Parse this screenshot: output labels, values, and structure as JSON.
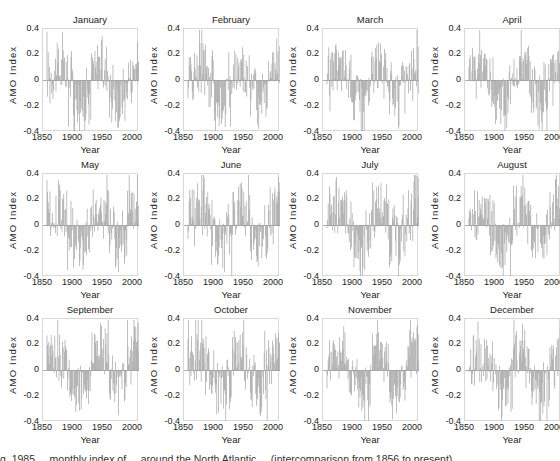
{
  "chart_data": {
    "type": "bar",
    "layout": "4x3 small multiples",
    "ylabel": "AMO Index",
    "xlabel": "Year",
    "ylim": [
      -0.4,
      0.4
    ],
    "yticks": [
      "0.4",
      "0.2",
      "0",
      "-0.2",
      "-0.4"
    ],
    "xlim": [
      1856,
      2010
    ],
    "xticks": [
      "1850",
      "1900",
      "1950",
      "2000"
    ],
    "grid": false,
    "bar_color": "#a9a9a9",
    "decades": [
      1860,
      1870,
      1880,
      1890,
      1900,
      1910,
      1920,
      1930,
      1940,
      1950,
      1960,
      1970,
      1980,
      1990,
      2000
    ],
    "series": [
      {
        "name": "January",
        "decade_means": [
          0.05,
          0.08,
          0.1,
          0.05,
          -0.12,
          -0.2,
          -0.18,
          0.05,
          0.15,
          0.12,
          -0.05,
          -0.2,
          -0.15,
          0.02,
          0.12
        ]
      },
      {
        "name": "February",
        "decade_means": [
          0.02,
          0.1,
          0.12,
          0.05,
          -0.15,
          -0.22,
          -0.18,
          0.08,
          0.15,
          0.1,
          -0.05,
          -0.22,
          -0.12,
          0.0,
          0.15
        ]
      },
      {
        "name": "March",
        "decade_means": [
          0.05,
          0.1,
          0.12,
          0.05,
          -0.12,
          -0.22,
          -0.15,
          0.08,
          0.15,
          0.1,
          -0.05,
          -0.2,
          -0.1,
          0.02,
          0.15
        ]
      },
      {
        "name": "April",
        "decade_means": [
          0.08,
          0.1,
          0.1,
          0.02,
          -0.15,
          -0.2,
          -0.12,
          0.08,
          0.15,
          0.1,
          -0.05,
          -0.2,
          -0.08,
          0.0,
          0.12
        ]
      },
      {
        "name": "May",
        "decade_means": [
          0.08,
          0.12,
          0.1,
          0.02,
          -0.12,
          -0.18,
          -0.1,
          0.1,
          0.15,
          0.12,
          -0.02,
          -0.18,
          -0.1,
          0.05,
          0.18
        ]
      },
      {
        "name": "June",
        "decade_means": [
          0.1,
          0.15,
          0.12,
          0.02,
          -0.12,
          -0.18,
          -0.12,
          0.1,
          0.18,
          0.12,
          -0.02,
          -0.18,
          -0.1,
          0.05,
          0.2
        ]
      },
      {
        "name": "July",
        "decade_means": [
          0.1,
          0.15,
          0.12,
          0.0,
          -0.15,
          -0.18,
          -0.12,
          0.1,
          0.18,
          0.12,
          -0.02,
          -0.15,
          -0.1,
          0.05,
          0.22
        ]
      },
      {
        "name": "August",
        "decade_means": [
          0.08,
          0.12,
          0.1,
          0.0,
          -0.15,
          -0.18,
          -0.12,
          0.12,
          0.2,
          0.12,
          -0.05,
          -0.15,
          -0.1,
          0.05,
          0.2
        ]
      },
      {
        "name": "September",
        "decade_means": [
          0.08,
          0.12,
          0.1,
          0.02,
          -0.15,
          -0.18,
          -0.1,
          0.12,
          0.2,
          0.12,
          -0.05,
          -0.15,
          -0.1,
          0.08,
          0.22
        ]
      },
      {
        "name": "October",
        "decade_means": [
          0.08,
          0.12,
          0.1,
          0.02,
          -0.12,
          -0.18,
          -0.12,
          0.12,
          0.2,
          0.12,
          -0.05,
          -0.18,
          -0.1,
          0.05,
          0.2
        ]
      },
      {
        "name": "November",
        "decade_means": [
          0.08,
          0.1,
          0.1,
          0.02,
          -0.12,
          -0.2,
          -0.15,
          0.08,
          0.18,
          0.12,
          -0.05,
          -0.2,
          -0.12,
          0.05,
          0.18
        ]
      },
      {
        "name": "December",
        "decade_means": [
          0.05,
          0.1,
          0.12,
          0.02,
          -0.12,
          -0.2,
          -0.15,
          0.08,
          0.18,
          0.12,
          -0.05,
          -0.22,
          -0.12,
          0.02,
          0.15
        ]
      }
    ]
  },
  "caption": "g. 1985 ... monthly index of ... around the North Atlantic ... (intercomparison from 1856 to present)"
}
